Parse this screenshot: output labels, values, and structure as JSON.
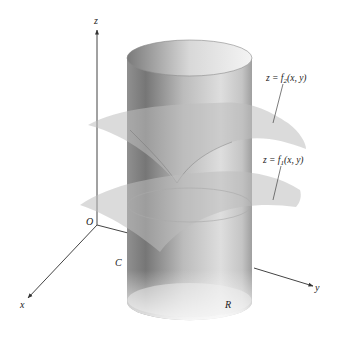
{
  "figure": {
    "axes": {
      "x_label": "x",
      "y_label": "y",
      "z_label": "z",
      "origin_label": "O"
    },
    "region_labels": {
      "boundary_curve": "C",
      "region": "R"
    },
    "surfaces": [
      {
        "id": "upper",
        "eq_prefix": "z = f",
        "subscript": "2",
        "eq_suffix": "(x, y)"
      },
      {
        "id": "lower",
        "eq_prefix": "z = f",
        "subscript": "1",
        "eq_suffix": "(x, y)"
      }
    ],
    "colors": {
      "axis": "#444444",
      "cylinder_dark": "#6e6e6e",
      "cylinder_light": "#e6e6e6",
      "surface": "#c8c8c8",
      "label": "#222222"
    }
  }
}
